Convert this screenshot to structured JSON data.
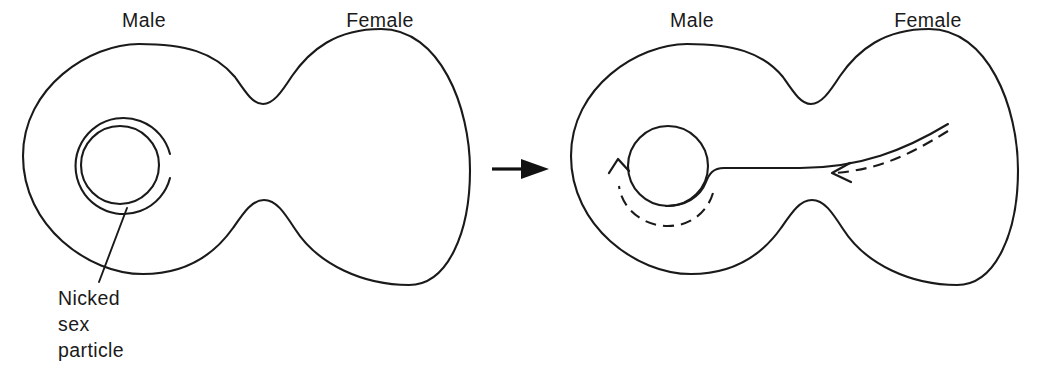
{
  "figure": {
    "background_color": "#ffffff",
    "ink_color": "#1a1a1a",
    "width": 1039,
    "height": 371
  },
  "panels": [
    {
      "id": "before",
      "name": "before-transfer",
      "labels": {
        "male": "Male",
        "female": "Female"
      },
      "callout": {
        "lines": [
          "Nicked",
          "sex",
          "particle"
        ],
        "target": "sex-particle-double-ring"
      },
      "sex_particle": {
        "state": "nicked",
        "rings": 2,
        "nick_position": "right",
        "note": "double-stranded circle with a nick (gap) in the outer strand"
      }
    },
    {
      "id": "after",
      "name": "during-transfer",
      "labels": {
        "male": "Male",
        "female": "Female"
      },
      "sex_particle": {
        "state": "unwinding",
        "rings": 1,
        "note": "single circle with one strand peeled off and passing into the female cell"
      },
      "motion": {
        "rolling_arrow": "counterclockwise-rolling-circle",
        "transfer_arrow": "strand-entering-female-cell"
      }
    }
  ],
  "transition": {
    "name": "transition-arrow",
    "direction": "right",
    "style": "solid-triangle"
  }
}
